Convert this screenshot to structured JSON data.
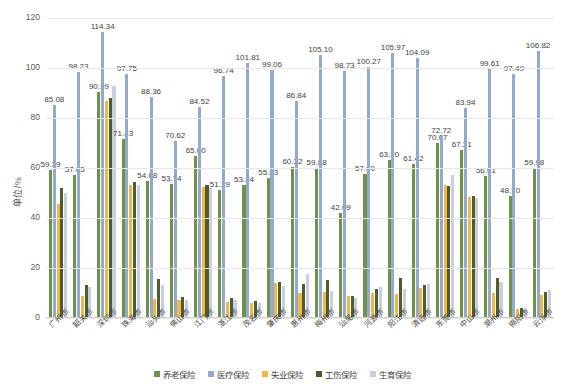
{
  "chart_data": {
    "type": "bar",
    "title": "",
    "xlabel": "",
    "ylabel": "单位/%",
    "ylim": [
      0,
      120
    ],
    "yticks": [
      0,
      20,
      40,
      60,
      80,
      100,
      120
    ],
    "grid": true,
    "legend_position": "bottom",
    "categories": [
      "广州市",
      "韶关市",
      "深圳市",
      "珠海市",
      "汕头市",
      "佛山市",
      "江门市",
      "湛江市",
      "茂名市",
      "肇庆市",
      "惠州市",
      "梅州市",
      "汕尾市",
      "河源市",
      "阳江市",
      "清远市",
      "东莞市",
      "中山市",
      "潮州市",
      "揭阳市",
      "云浮市"
    ],
    "series": [
      {
        "name": "养老保险",
        "color": "#70914b",
        "values": [
          59.39,
          57.05,
          90.39,
          71.43,
          54.68,
          53.74,
          65.0,
          51.39,
          53.24,
          55.83,
          60.32,
          59.88,
          42.09,
          57.6,
          63.2,
          61.42,
          70.07,
          67.31,
          56.61,
          48.7,
          59.98
        ]
      },
      {
        "name": "医疗保险",
        "color": "#93a9cf",
        "values": [
          85.08,
          98.23,
          114.34,
          97.75,
          88.36,
          70.62,
          84.52,
          96.74,
          101.81,
          99.06,
          86.84,
          105.1,
          98.73,
          100.27,
          105.97,
          104.09,
          72.72,
          83.94,
          99.61,
          97.49,
          106.82
        ]
      },
      {
        "name": "失业保险",
        "color": "#efb944",
        "values": [
          45.8,
          9.0,
          86.9,
          53.4,
          7.6,
          7.2,
          52.6,
          6.5,
          6.0,
          14.0,
          10.0,
          10.5,
          9.0,
          10.2,
          9.5,
          12.2,
          53.2,
          48.6,
          10.2,
          3.5,
          9.4
        ]
      },
      {
        "name": "工伤保险",
        "color": "#4f5d2e",
        "values": [
          52.0,
          13.2,
          88.0,
          54.5,
          15.6,
          8.6,
          53.2,
          8.0,
          7.0,
          14.5,
          13.5,
          15.2,
          8.8,
          11.6,
          16.0,
          13.2,
          52.8,
          49.0,
          16.2,
          4.2,
          10.5
        ]
      },
      {
        "name": "生育保险",
        "color": "#c8cfdd",
        "values": [
          50.2,
          12.5,
          93.0,
          53.2,
          13.2,
          7.4,
          52.0,
          7.2,
          6.2,
          13.0,
          17.8,
          11.0,
          8.2,
          12.4,
          11.8,
          13.8,
          57.2,
          48.2,
          14.5,
          3.8,
          11.2
        ]
      }
    ],
    "labeled_series": [
      "养老保险",
      "医疗保险"
    ]
  },
  "axis": {
    "y_title": "单位/%"
  }
}
